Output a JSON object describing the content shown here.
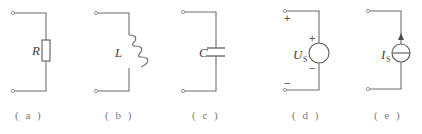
{
  "diagram": {
    "type": "circuit-element-symbols",
    "colors": {
      "wire": "#6e6e6e",
      "text": "#444444",
      "caption": "#777777",
      "background": "#ffffff"
    },
    "elements": [
      {
        "id": "a",
        "kind": "resistor",
        "symbol": "R",
        "subscript": "",
        "caption": "( a )"
      },
      {
        "id": "b",
        "kind": "inductor",
        "symbol": "L",
        "subscript": "",
        "caption": "( b )"
      },
      {
        "id": "c",
        "kind": "capacitor",
        "symbol": "C",
        "subscript": "",
        "caption": "( c )"
      },
      {
        "id": "d",
        "kind": "voltage-source",
        "symbol": "U",
        "subscript": "S",
        "caption": "( d )",
        "terminal_plus": "+",
        "terminal_minus": "−",
        "source_plus": "+",
        "source_minus": "−"
      },
      {
        "id": "e",
        "kind": "current-source",
        "symbol": "I",
        "subscript": "S",
        "caption": "( e )"
      }
    ]
  }
}
